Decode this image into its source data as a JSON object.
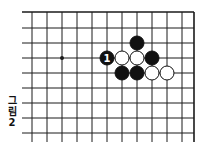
{
  "caption": {
    "chars": [
      "그",
      "림",
      "2"
    ],
    "text": "그림 2"
  },
  "board": {
    "edges": [
      "top",
      "right"
    ],
    "line_color": "#1a1a1a",
    "background": "#ffffff",
    "grid": {
      "x": [
        32,
        47,
        62,
        77,
        92,
        107,
        122,
        137,
        152,
        167,
        182,
        194
      ],
      "y": [
        12,
        28,
        43,
        58,
        73,
        88,
        103,
        118,
        133
      ],
      "x_extend_left": 22,
      "y_extend_bottom": 142
    },
    "star_points": [
      {
        "col": 2,
        "row": 3
      }
    ],
    "stones": [
      {
        "color": "black",
        "col": 7,
        "row": 2,
        "label": ""
      },
      {
        "color": "black",
        "col": 5,
        "row": 3,
        "label": "1"
      },
      {
        "color": "white",
        "col": 6,
        "row": 3,
        "label": ""
      },
      {
        "color": "white",
        "col": 7,
        "row": 3,
        "label": ""
      },
      {
        "color": "black",
        "col": 8,
        "row": 3,
        "label": ""
      },
      {
        "color": "black",
        "col": 6,
        "row": 4,
        "label": ""
      },
      {
        "color": "black",
        "col": 7,
        "row": 4,
        "label": ""
      },
      {
        "color": "white",
        "col": 8,
        "row": 4,
        "label": ""
      },
      {
        "color": "white",
        "col": 9,
        "row": 4,
        "label": ""
      }
    ],
    "stone_radius": 7
  }
}
